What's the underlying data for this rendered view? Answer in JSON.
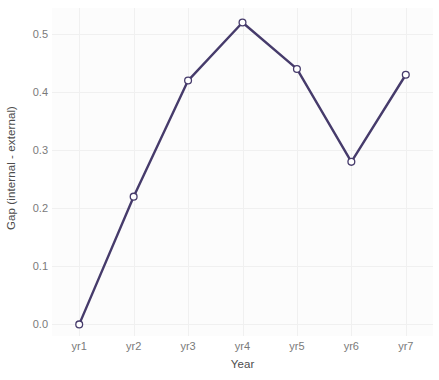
{
  "chart_data": {
    "type": "line",
    "title": "",
    "subtitle": "",
    "xlabel": "Year",
    "ylabel": "Gap (internal - external)",
    "categories": [
      "yr1",
      "yr2",
      "yr3",
      "yr4",
      "yr5",
      "yr6",
      "yr7"
    ],
    "values": [
      0.0,
      0.22,
      0.42,
      0.52,
      0.44,
      0.28,
      0.43
    ],
    "series": [
      {
        "name": "Gap (internal - external)",
        "values": [
          0.0,
          0.22,
          0.42,
          0.52,
          0.44,
          0.28,
          0.43
        ]
      }
    ],
    "ylim": [
      -0.02,
      0.545
    ],
    "yticks": [
      0.0,
      0.1,
      0.2,
      0.3,
      0.4,
      0.5
    ],
    "ytick_labels": [
      "0.0",
      "0.1",
      "0.2",
      "0.3",
      "0.4",
      "0.5"
    ],
    "xtick_labels": [
      "yr1",
      "yr2",
      "yr3",
      "yr4",
      "yr5",
      "yr6",
      "yr7"
    ],
    "grid": true,
    "legend": false,
    "legend_position": "none",
    "colors": {
      "line": "#463B6B",
      "marker_fill": "#ffffff",
      "marker_stroke": "#463B6B",
      "panel_background": "#fcfcfc",
      "grid_line": "#f0f0f0",
      "axis_text": "#7a7a7a",
      "axis_title_text": "#4d4d4d",
      "canvas_background": "#ffffff"
    },
    "line_width": 2.4,
    "marker_radius": 3.4
  }
}
